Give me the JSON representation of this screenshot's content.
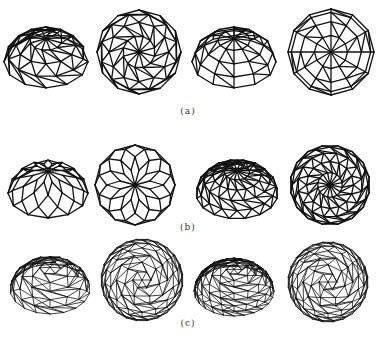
{
  "figure": {
    "line_color": "#111111",
    "rows": [
      {
        "label": "(a)",
        "label_y": 112,
        "domes": [
          {
            "name": "dome-a1-perspective",
            "type": "kiewitt-persp",
            "cx": 46,
            "cy": 50,
            "r": 42,
            "sides": 12,
            "rings": 4,
            "squash": 0.85,
            "tilt": true
          },
          {
            "name": "dome-a2-plan",
            "type": "kiewitt-plan",
            "cx": 139,
            "cy": 52,
            "r": 42,
            "sides": 12,
            "rings": 4
          },
          {
            "name": "dome-a3-perspective",
            "type": "schwedler-persp",
            "cx": 234,
            "cy": 50,
            "r": 42,
            "sides": 12,
            "rings": 4,
            "squash": 0.85,
            "tilt": true
          },
          {
            "name": "dome-a4-plan",
            "type": "schwedler-plan",
            "cx": 331,
            "cy": 52,
            "r": 43,
            "sides": 12,
            "rings": 4
          }
        ]
      },
      {
        "label": "(b)",
        "label_y": 225,
        "domes": [
          {
            "name": "dome-b1-perspective",
            "type": "lamella-persp",
            "cx": 48,
            "cy": 182,
            "r": 40,
            "sides": 12,
            "rings": 4,
            "squash": 0.85,
            "tilt": true
          },
          {
            "name": "dome-b2-plan",
            "type": "lamella-plan",
            "cx": 135,
            "cy": 185,
            "r": 40,
            "sides": 12,
            "rings": 4
          },
          {
            "name": "dome-b3-perspective",
            "type": "kiewitt-persp",
            "cx": 237,
            "cy": 182,
            "r": 41,
            "sides": 16,
            "rings": 5,
            "squash": 0.85,
            "tilt": true
          },
          {
            "name": "dome-b4-plan",
            "type": "kiewitt-plan",
            "cx": 330,
            "cy": 185,
            "r": 40,
            "sides": 16,
            "rings": 5
          }
        ]
      },
      {
        "label": "(c)",
        "label_y": 324,
        "domes": [
          {
            "name": "dome-c1-perspective",
            "type": "geodesic-persp",
            "cx": 50,
            "cy": 278,
            "r": 40,
            "sides": 18,
            "rings": 6,
            "squash": 0.9,
            "tilt": true
          },
          {
            "name": "dome-c2-plan",
            "type": "geodesic-plan",
            "cx": 142,
            "cy": 280,
            "r": 41,
            "sides": 24,
            "rings": 7
          },
          {
            "name": "dome-c3-perspective",
            "type": "geodesic-persp",
            "cx": 234,
            "cy": 280,
            "r": 40,
            "sides": 24,
            "rings": 8,
            "squash": 0.9,
            "tilt": true
          },
          {
            "name": "dome-c4-plan",
            "type": "geodesic-plan",
            "cx": 328,
            "cy": 282,
            "r": 40,
            "sides": 24,
            "rings": 7
          }
        ]
      }
    ],
    "label_x": 188
  }
}
